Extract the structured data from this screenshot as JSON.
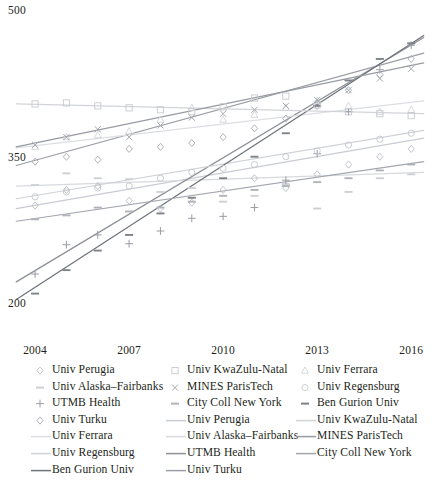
{
  "chart_data": {
    "type": "scatter",
    "title": "",
    "xlabel": "",
    "ylabel": "",
    "xlim": [
      2003.2,
      2016.6
    ],
    "ylim": [
      500,
      185
    ],
    "y_axis_inverted": true,
    "grid": false,
    "legend_position": "bottom",
    "xticks": [
      2004,
      2007,
      2010,
      2013,
      2016
    ],
    "xtick_labels": [
      "2004",
      "2007",
      "2010",
      "2013",
      "2016"
    ],
    "yticks": [
      200,
      350,
      500
    ],
    "ytick_labels": [
      "200",
      "350",
      "500"
    ],
    "series": [
      {
        "name": "Univ Perugia",
        "marker": "diamond",
        "color": "#b9bcc2",
        "line_color": "#c9ccd2",
        "x": [
          2004,
          2005,
          2006,
          2007,
          2008,
          2009,
          2010,
          2011,
          2012,
          2013,
          2014,
          2015,
          2016
        ],
        "y": [
          302,
          318,
          322,
          307,
          299,
          305,
          318,
          330,
          320,
          334,
          344,
          352,
          360
        ],
        "fit": {
          "x0": 2003.4,
          "y0": 299,
          "x1": 2016.4,
          "y1": 371
        }
      },
      {
        "name": "Univ Alaska–Fairbanks",
        "marker": "dash",
        "color": "#cdd0d4",
        "line_color": "#d7d9dd",
        "x": [
          2004,
          2005,
          2006,
          2007,
          2008,
          2009,
          2010,
          2011,
          2012,
          2013,
          2014,
          2015,
          2016
        ],
        "y": [
          323,
          335,
          330,
          329,
          316,
          320,
          306,
          312,
          324,
          299,
          316,
          330,
          334
        ],
        "fit": {
          "x0": 2003.4,
          "y0": 322,
          "x1": 2016.4,
          "y1": 336
        }
      },
      {
        "name": "UTMB Health",
        "marker": "plus",
        "color": "#9a9da4",
        "line_color": "#8d9097",
        "x": [
          2004,
          2005,
          2006,
          2007,
          2008,
          2009,
          2010,
          2011,
          2012,
          2013,
          2014,
          2015,
          2016
        ],
        "y": [
          232,
          262,
          272,
          263,
          276,
          289,
          291,
          300,
          328,
          355,
          398,
          441,
          466
        ],
        "fit": {
          "x0": 2003.4,
          "y0": 224,
          "x1": 2016.4,
          "y1": 474
        }
      },
      {
        "name": "Univ Turku",
        "marker": "diamond",
        "color": "#a8abb1",
        "line_color": "#9b9ea5",
        "x": [
          2004,
          2005,
          2006,
          2007,
          2008,
          2009,
          2010,
          2011,
          2012,
          2013,
          2014,
          2015,
          2016
        ],
        "y": [
          347,
          352,
          349,
          360,
          362,
          366,
          372,
          381,
          391,
          404,
          420,
          436,
          452
        ],
        "fit": {
          "x0": 2003.4,
          "y0": 343,
          "x1": 2016.4,
          "y1": 458
        }
      },
      {
        "name": "Univ Ferrara",
        "marker": "triangle",
        "color": "#d2d5d9",
        "line_color": "#dcdee2",
        "x": [
          2004,
          2005,
          2006,
          2007,
          2008,
          2009,
          2010,
          2011,
          2012,
          2013,
          2014,
          2015,
          2016
        ],
        "y": [
          362,
          372,
          374,
          378,
          390,
          402,
          390,
          395,
          402,
          409,
          404,
          398,
          400
        ],
        "fit": {
          "x0": 2003.4,
          "y0": 361,
          "x1": 2016.4,
          "y1": 409
        }
      },
      {
        "name": "Univ Regensburg",
        "marker": "circle",
        "color": "#c4c7cc",
        "line_color": "#cfd2d6",
        "x": [
          2004,
          2005,
          2006,
          2007,
          2008,
          2009,
          2010,
          2011,
          2012,
          2013,
          2014,
          2015,
          2016
        ],
        "y": [
          311,
          316,
          320,
          322,
          330,
          336,
          340,
          344,
          352,
          358,
          364,
          370,
          376
        ],
        "fit": {
          "x0": 2003.4,
          "y0": 309,
          "x1": 2016.4,
          "y1": 379
        }
      },
      {
        "name": "Ben Gurion Univ",
        "marker": "dash",
        "color": "#7e8289",
        "line_color": "#6f737a",
        "x": [
          2004,
          2005,
          2006,
          2007,
          2008,
          2009,
          2010,
          2011,
          2012,
          2013,
          2014,
          2015,
          2016
        ],
        "y": [
          212,
          236,
          256,
          272,
          294,
          310,
          330,
          352,
          376,
          404,
          430,
          452,
          468
        ],
        "fit": {
          "x0": 2003.4,
          "y0": 206,
          "x1": 2016.4,
          "y1": 476
        }
      },
      {
        "name": "Univ KwaZulu-Natal",
        "marker": "square",
        "color": "#c7cacf",
        "line_color": "#d2d4d8",
        "x": [
          2004,
          2005,
          2006,
          2007,
          2008,
          2009,
          2010,
          2011,
          2012,
          2013,
          2014,
          2015,
          2016
        ],
        "y": [
          406,
          407,
          404,
          402,
          400,
          398,
          403,
          412,
          414,
          405,
          398,
          396,
          394
        ],
        "fit": {
          "x0": 2003.4,
          "y0": 406,
          "x1": 2016.4,
          "y1": 396
        }
      },
      {
        "name": "MINES ParisTech",
        "marker": "cross",
        "color": "#a5a8ae",
        "line_color": "#989ba2",
        "x": [
          2004,
          2005,
          2006,
          2007,
          2008,
          2009,
          2010,
          2011,
          2012,
          2013,
          2014,
          2015,
          2016
        ],
        "y": [
          364,
          372,
          380,
          372,
          384,
          392,
          396,
          400,
          404,
          410,
          420,
          432,
          442
        ],
        "fit": {
          "x0": 2003.4,
          "y0": 362,
          "x1": 2016.4,
          "y1": 448
        }
      },
      {
        "name": "City Coll New York",
        "marker": "dash",
        "color": "#b0b3b9",
        "line_color": "#a3a6ad",
        "x": [
          2004,
          2005,
          2006,
          2007,
          2008,
          2009,
          2010,
          2011,
          2012,
          2013,
          2014,
          2015,
          2016
        ],
        "y": [
          288,
          292,
          300,
          296,
          300,
          306,
          312,
          318,
          322,
          326,
          330,
          338,
          344
        ],
        "fit": {
          "x0": 2003.4,
          "y0": 286,
          "x1": 2016.4,
          "y1": 347
        }
      }
    ]
  },
  "axes": {
    "y_labels": [
      {
        "text": "200",
        "value": 200
      },
      {
        "text": "350",
        "value": 350
      },
      {
        "text": "500",
        "value": 500
      }
    ],
    "x_labels": [
      {
        "text": "2004",
        "value": 2004
      },
      {
        "text": "2007",
        "value": 2007
      },
      {
        "text": "2010",
        "value": 2010
      },
      {
        "text": "2013",
        "value": 2013
      },
      {
        "text": "2016",
        "value": 2016
      }
    ]
  },
  "legend": {
    "columns": [
      {
        "items": [
          {
            "label": "Univ Perugia",
            "key": "marker-diamond",
            "color": "#b9bcc2"
          },
          {
            "label": "Univ Alaska–Fairbanks",
            "key": "marker-dash",
            "color": "#cdd0d4"
          },
          {
            "label": "UTMB Health",
            "key": "marker-plus",
            "color": "#9a9da4"
          },
          {
            "label": "Univ Turku",
            "key": "marker-diamond",
            "color": "#a8abb1"
          },
          {
            "label": "Univ Ferrara",
            "key": "line",
            "color": "#dcdee2"
          },
          {
            "label": "Univ Regensburg",
            "key": "line",
            "color": "#cfd2d6"
          },
          {
            "label": "Ben Gurion Univ",
            "key": "line",
            "color": "#6f737a"
          }
        ]
      },
      {
        "items": [
          {
            "label": "Univ KwaZulu-Natal",
            "key": "marker-square",
            "color": "#c7cacf"
          },
          {
            "label": "MINES ParisTech",
            "key": "marker-cross",
            "color": "#a5a8ae"
          },
          {
            "label": "City Coll New York",
            "key": "marker-dash",
            "color": "#b0b3b9"
          },
          {
            "label": "Univ Perugia",
            "key": "line",
            "color": "#c9ccd2"
          },
          {
            "label": "Univ Alaska–Fairbanks",
            "key": "line",
            "color": "#d7d9dd"
          },
          {
            "label": "UTMB Health",
            "key": "line",
            "color": "#8d9097"
          },
          {
            "label": "Univ Turku",
            "key": "line",
            "color": "#9b9ea5"
          }
        ]
      },
      {
        "items": [
          {
            "label": "Univ Ferrara",
            "key": "marker-triangle",
            "color": "#d2d5d9"
          },
          {
            "label": "Univ Regensburg",
            "key": "marker-circle",
            "color": "#c4c7cc"
          },
          {
            "label": "Ben Gurion Univ",
            "key": "marker-dash",
            "color": "#7e8289"
          },
          {
            "label": "Univ KwaZulu-Natal",
            "key": "line",
            "color": "#d2d4d8"
          },
          {
            "label": "MINES ParisTech",
            "key": "line",
            "color": "#989ba2"
          },
          {
            "label": "City Coll New York",
            "key": "line",
            "color": "#a3a6ad"
          }
        ]
      }
    ]
  }
}
